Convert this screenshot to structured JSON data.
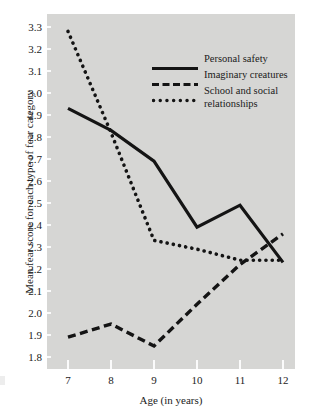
{
  "chart_data": {
    "type": "line",
    "title": "",
    "xlabel": "Age (in years)",
    "ylabel": "Mean fear score for each type of fear category",
    "x": [
      7,
      8,
      9,
      10,
      11,
      12
    ],
    "xticklabels": [
      "7",
      "8",
      "9",
      "10",
      "11",
      "12"
    ],
    "xlim": [
      6.7,
      12.3
    ],
    "ylim": [
      1.75,
      3.35
    ],
    "yticks": [
      1.8,
      1.9,
      2.0,
      2.1,
      2.2,
      2.3,
      2.4,
      2.5,
      2.6,
      2.7,
      2.8,
      2.9,
      3.0,
      3.1,
      3.2,
      3.3
    ],
    "yticklabels": [
      "1.8",
      "1.9",
      "2.0",
      "2.1",
      "2.2",
      "2.3",
      "2.4",
      "2.5",
      "2.6",
      "2.7",
      "2.8",
      "2.9",
      "3.0",
      "3.1",
      "3.2",
      "3.3"
    ],
    "grid": false,
    "legend_position": "upper right",
    "plot_background": "#d6d6d4",
    "series": [
      {
        "name": "Personal safety",
        "style": "solid",
        "color": "#141414",
        "values": [
          2.93,
          2.83,
          2.69,
          2.39,
          2.49,
          2.23
        ]
      },
      {
        "name": "Imaginary creatures",
        "style": "dashed",
        "color": "#141414",
        "values": [
          1.89,
          1.95,
          1.85,
          2.04,
          2.22,
          2.36
        ]
      },
      {
        "name": "School and social relationships",
        "style": "dotted",
        "color": "#141414",
        "values": [
          3.28,
          2.82,
          2.33,
          2.29,
          2.24,
          2.24
        ]
      }
    ]
  },
  "legend": {
    "items": [
      {
        "label": "Personal safety",
        "label2": ""
      },
      {
        "label": "Imaginary creatures",
        "label2": ""
      },
      {
        "label": "School and social",
        "label2": "relationships"
      }
    ]
  },
  "axes": {
    "xlabel": "Age (in years)",
    "ylabel": "Mean fear score for each type of fear category"
  }
}
